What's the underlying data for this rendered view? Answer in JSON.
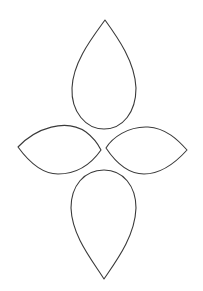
{
  "figure": {
    "title": "Four-petal flower template outline",
    "background": "#ffffff",
    "stroke_color": "#3a3a3a",
    "shapes": [
      {
        "name": "top-petal",
        "type": "teardrop",
        "orientation": "point-up"
      },
      {
        "name": "left-petal",
        "type": "leaf",
        "orientation": "horizontal"
      },
      {
        "name": "right-petal",
        "type": "leaf",
        "orientation": "horizontal"
      },
      {
        "name": "bottom-petal",
        "type": "teardrop",
        "orientation": "point-down"
      }
    ]
  }
}
